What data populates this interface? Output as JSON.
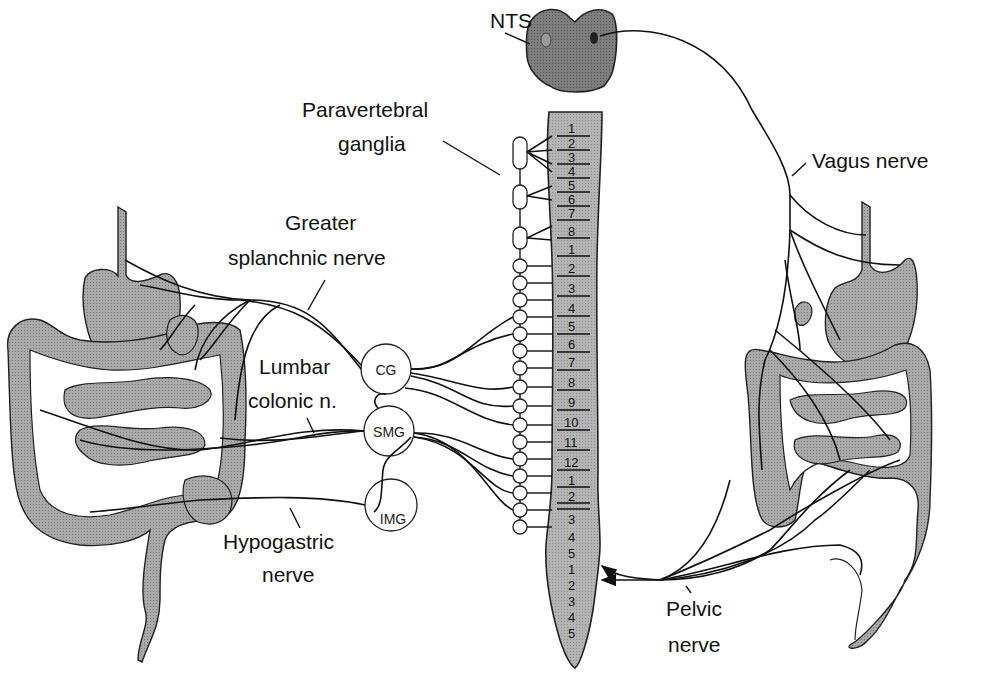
{
  "figure": {
    "colors": {
      "background": "#ffffff",
      "brainstem": "#7a7a7a",
      "spinal_cord": "#b0b0b0",
      "organ_fill": "#a9a9a9",
      "line": "#111111"
    }
  },
  "labels": {
    "nts": "NTS",
    "paravertebral_1": "Paravertebral",
    "paravertebral_2": "ganglia",
    "greater_splanchnic_1": "Greater",
    "greater_splanchnic_2": "splanchnic nerve",
    "lumbar_colonic_1": "Lumbar",
    "lumbar_colonic_2": "colonic n.",
    "hypogastric_1": "Hypogastric",
    "hypogastric_2": "nerve",
    "vagus": "Vagus nerve",
    "pelvic_1": "Pelvic",
    "pelvic_2": "nerve"
  },
  "ganglia": {
    "cg": "CG",
    "smg": "SMG",
    "img": "IMG"
  },
  "spinal_segments": {
    "cervical": [
      "1",
      "2",
      "3",
      "4",
      "5",
      "6",
      "7",
      "8"
    ],
    "thoracic": [
      "1",
      "2",
      "3",
      "4",
      "5",
      "6",
      "7",
      "8",
      "9",
      "10",
      "11",
      "12"
    ],
    "lumbar": [
      "1",
      "2",
      "3",
      "4",
      "5"
    ],
    "sacral": [
      "1",
      "2",
      "3",
      "4",
      "5"
    ]
  }
}
